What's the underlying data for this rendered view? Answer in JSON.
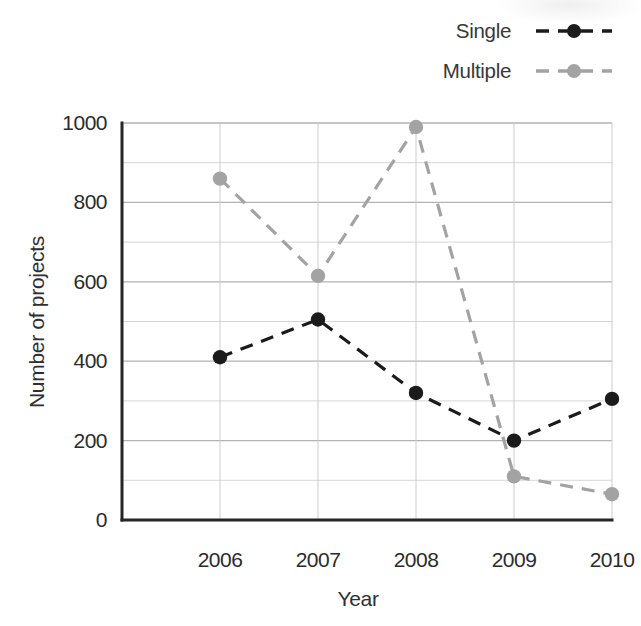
{
  "legend": {
    "items": [
      {
        "label": "Single"
      },
      {
        "label": "Multiple"
      }
    ]
  },
  "chart_data": {
    "type": "line",
    "x": [
      2006,
      2007,
      2008,
      2009,
      2010
    ],
    "series": [
      {
        "name": "Single",
        "color": "#1b1b1b",
        "line_style": "dashed",
        "marker": "circle",
        "values": [
          410,
          505,
          320,
          200,
          305
        ]
      },
      {
        "name": "Multiple",
        "color": "#a3a3a3",
        "line_style": "dashed",
        "marker": "circle",
        "values": [
          860,
          615,
          990,
          110,
          65
        ]
      }
    ],
    "xlabel": "Year",
    "ylabel": "Number of projects",
    "ylim": [
      0,
      1000
    ],
    "yticks": [
      0,
      200,
      400,
      600,
      800,
      1000
    ],
    "minor_ytick_step": 100,
    "grid": true,
    "legend_position": "top-right",
    "colors": {
      "axis": "#262626",
      "major_grid": "#b3b3b3",
      "minor_grid": "#d6d6d6",
      "vertical_grid": "#cccccc",
      "tick_text": "#2b2b2b"
    }
  }
}
